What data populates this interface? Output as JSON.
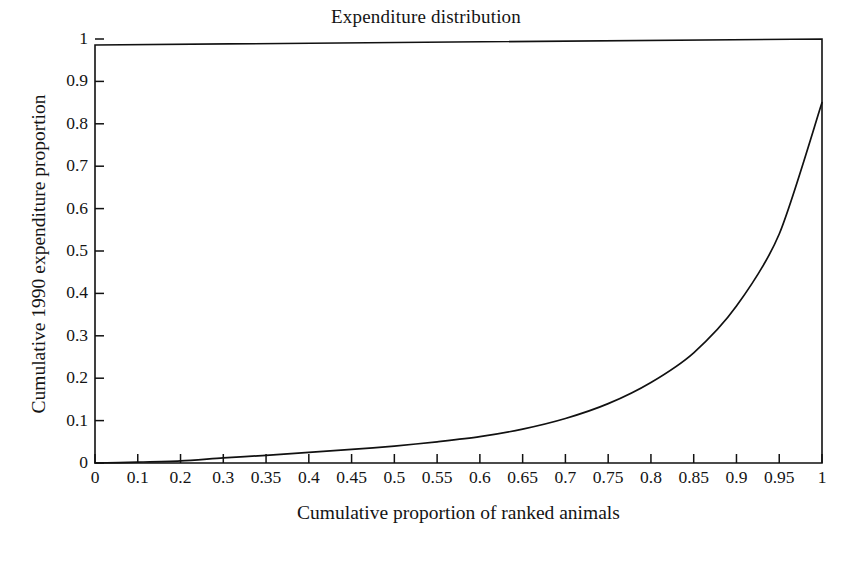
{
  "chart_data": {
    "type": "line",
    "title": "Expenditure distribution",
    "xlabel": "Cumulative proportion of ranked animals",
    "ylabel": "Cumulative 1990 expenditure proportion",
    "categories": [
      "0",
      "0.1",
      "0.2",
      "0.3",
      "0.35",
      "0.4",
      "0.45",
      "0.5",
      "0.55",
      "0.6",
      "0.65",
      "0.7",
      "0.75",
      "0.8",
      "0.85",
      "0.9",
      "0.95",
      "1"
    ],
    "x": [
      0,
      0.1,
      0.2,
      0.3,
      0.35,
      0.4,
      0.45,
      0.5,
      0.55,
      0.6,
      0.65,
      0.7,
      0.75,
      0.8,
      0.85,
      0.9,
      0.95,
      1
    ],
    "values": [
      0,
      0.002,
      0.005,
      0.012,
      0.018,
      0.025,
      0.032,
      0.04,
      0.05,
      0.062,
      0.08,
      0.105,
      0.14,
      0.19,
      0.26,
      0.37,
      0.54,
      0.85
    ],
    "series": [
      {
        "name": "Cumulative 1990 expenditure proportion",
        "values": [
          0,
          0.002,
          0.005,
          0.012,
          0.018,
          0.025,
          0.032,
          0.04,
          0.05,
          0.062,
          0.08,
          0.105,
          0.14,
          0.19,
          0.26,
          0.37,
          0.54,
          0.85
        ]
      }
    ],
    "ytick_labels": [
      "1",
      "0.9",
      "0.8",
      "0.7",
      "0.6",
      "0.5",
      "0.4",
      "0.3",
      "0.2",
      "0.1",
      "0"
    ],
    "yticks": [
      1,
      0.9,
      0.8,
      0.7,
      0.6,
      0.5,
      0.4,
      0.3,
      0.2,
      0.1,
      0
    ],
    "xlim": [
      0,
      1
    ],
    "ylim": [
      0,
      1
    ],
    "grid": false,
    "legend": "none",
    "line_color": "#111111",
    "axis_color": "#111111",
    "background": "#ffffff"
  }
}
